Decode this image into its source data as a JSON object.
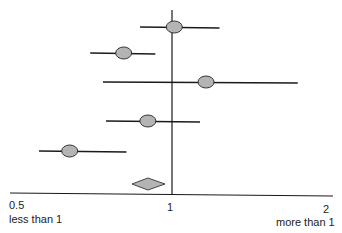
{
  "chart_data": {
    "type": "forest",
    "title": "",
    "xscale": "log",
    "xlim": [
      0.5,
      2
    ],
    "reference_line": 1,
    "tick_labels": [
      "0.5",
      "1",
      "2"
    ],
    "direction_labels": {
      "left": "less than 1",
      "right": "more than 1"
    },
    "studies": [
      {
        "estimate": 1.01,
        "ci_low": 0.87,
        "ci_high": 1.23
      },
      {
        "estimate": 0.81,
        "ci_low": 0.7,
        "ci_high": 0.93
      },
      {
        "estimate": 1.16,
        "ci_low": 0.74,
        "ci_high": 1.73
      },
      {
        "estimate": 0.9,
        "ci_low": 0.75,
        "ci_high": 1.13
      },
      {
        "estimate": 0.64,
        "ci_low": 0.56,
        "ci_high": 0.82
      }
    ],
    "pooled": {
      "estimate": 0.9,
      "ci_low": 0.84,
      "ci_high": 0.97
    },
    "colors": {
      "marker": "#b4b4b4",
      "line": "#1a1a1a"
    }
  },
  "axis": {
    "tick_0_5": "0.5",
    "tick_1": "1",
    "tick_2": "2",
    "left_label": "less than 1",
    "right_label": "more than 1"
  }
}
